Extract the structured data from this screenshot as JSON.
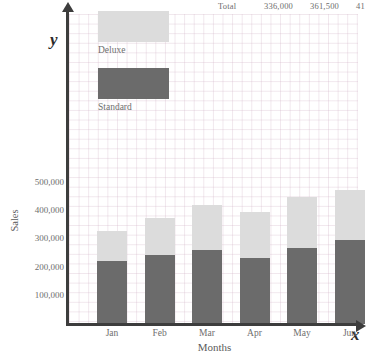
{
  "top_table_row": {
    "label": "Total",
    "values": [
      "336,000",
      "361,500",
      "41"
    ]
  },
  "axis_letters": {
    "y": "y",
    "x": "x"
  },
  "legend": {
    "deluxe_label": "Deluxe",
    "standard_label": "Standard",
    "deluxe_color": "#dcdcdc",
    "standard_color": "#6b6b6b"
  },
  "chart_data": {
    "type": "bar",
    "title": "",
    "subtype": "stacked",
    "xlabel": "Months",
    "ylabel": "Sales",
    "categories": [
      "Jan",
      "Feb",
      "Mar",
      "Apr",
      "May",
      "Jun"
    ],
    "series": [
      {
        "name": "Standard",
        "color": "#6b6b6b",
        "values": [
          223000,
          245000,
          262000,
          234000,
          270000,
          298000
        ]
      },
      {
        "name": "Deluxe",
        "color": "#dcdcdc",
        "values": [
          107000,
          131000,
          160000,
          163000,
          180000,
          177000
        ]
      }
    ],
    "totals": [
      330000,
      376000,
      422000,
      397000,
      450000,
      475000
    ],
    "ylim": [
      0,
      560000
    ],
    "yticks": [
      100000,
      200000,
      300000,
      400000,
      500000
    ],
    "ytick_labels": [
      "100,000",
      "200,000",
      "300,000",
      "400,000",
      "500,000"
    ],
    "grid": true,
    "legend_position": "upper-left-inside"
  }
}
